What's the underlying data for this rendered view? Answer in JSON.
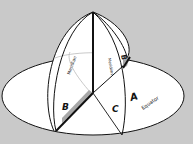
{
  "diagram": {
    "background": "#c9c9c9",
    "labels": {
      "meridian_left": "Meridian",
      "meridian_right": "Meridian",
      "equator": "Equator",
      "a": "A",
      "b": "B",
      "c": "C"
    },
    "colors": {
      "surface": "#ffffff",
      "stroke": "#111111",
      "faint_line": "#b8b8b8",
      "shadow_band": "#a8a8a8"
    }
  }
}
